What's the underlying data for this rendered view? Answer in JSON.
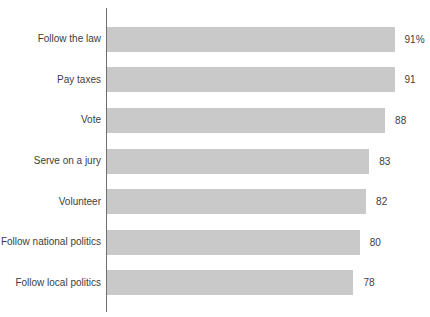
{
  "chart_data": {
    "type": "bar",
    "orientation": "horizontal",
    "title": "",
    "xlabel": "",
    "ylabel": "",
    "xlim": [
      0,
      100
    ],
    "grid": false,
    "legend": false,
    "categories": [
      "Follow the law",
      "Pay taxes",
      "Vote",
      "Serve on a jury",
      "Volunteer",
      "Follow national politics",
      "Follow local politics"
    ],
    "values": [
      91,
      91,
      88,
      83,
      82,
      80,
      78
    ],
    "display_labels": [
      "91%",
      "91",
      "88",
      "83",
      "82",
      "80",
      "78"
    ],
    "bar_color": "#c9c9c9",
    "text_color": "#3d3d3d",
    "axis_color": "#6f6f6f"
  }
}
